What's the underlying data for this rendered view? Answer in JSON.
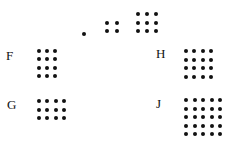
{
  "puzzle": {
    "sequence": [
      {
        "name": "term-1",
        "cols": 1,
        "rows": 1,
        "count": 1,
        "origin": [
          82,
          32
        ],
        "spacing": [
          9,
          8
        ]
      },
      {
        "name": "term-2",
        "cols": 2,
        "rows": 2,
        "count": 4,
        "origin": [
          105,
          21
        ],
        "spacing": [
          10,
          8
        ]
      },
      {
        "name": "term-3",
        "cols": 3,
        "rows": 3,
        "count": 9,
        "origin": [
          136,
          12
        ],
        "spacing": [
          9,
          8.5
        ]
      }
    ],
    "options": [
      {
        "label": "F",
        "cols": 3,
        "rows": 4,
        "count": 12,
        "label_pos": [
          6,
          49
        ],
        "origin": [
          37,
          49
        ],
        "spacing": [
          8,
          8.4
        ]
      },
      {
        "label": "G",
        "cols": 4,
        "rows": 3,
        "count": 12,
        "label_pos": [
          7,
          98
        ],
        "origin": [
          37,
          99
        ],
        "spacing": [
          8.4,
          8.5
        ]
      },
      {
        "label": "H",
        "cols": 4,
        "rows": 4,
        "count": 16,
        "label_pos": [
          156,
          47
        ],
        "origin": [
          184,
          49
        ],
        "spacing": [
          8.4,
          8.6
        ]
      },
      {
        "label": "J",
        "cols": 5,
        "rows": 5,
        "count": 25,
        "label_pos": [
          156,
          97
        ],
        "origin": [
          184,
          98
        ],
        "spacing": [
          8.5,
          8.5
        ]
      }
    ],
    "dot_color": "#111111",
    "background": "#ffffff"
  }
}
